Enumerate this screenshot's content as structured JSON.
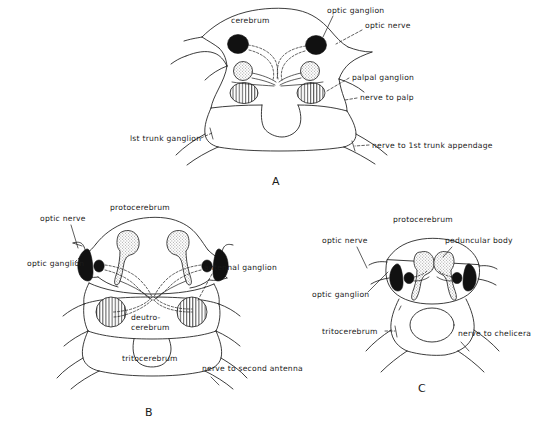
{
  "figure": {
    "background_color": "#ffffff",
    "ink_color": "#1a1a1a",
    "panels": [
      {
        "id": "A",
        "letter": "A",
        "labels": [
          {
            "name": "cerebrum",
            "text": "cerebrum"
          },
          {
            "name": "optic-ganglion",
            "text": "optic ganglion"
          },
          {
            "name": "optic-nerve",
            "text": "optic nerve"
          },
          {
            "name": "palpal-ganglion",
            "text": "palpal ganglion"
          },
          {
            "name": "nerve-to-palp",
            "text": "nerve to palp"
          },
          {
            "name": "first-trunk-ganglion",
            "text": "lst trunk ganglion"
          },
          {
            "name": "nerve-to-first-trunk-appendage",
            "text": "nerve to 1st trunk appendage"
          }
        ]
      },
      {
        "id": "B",
        "letter": "B",
        "labels": [
          {
            "name": "protocerebrum",
            "text": "protocerebrum"
          },
          {
            "name": "optic-nerve",
            "text": "optic nerve"
          },
          {
            "name": "optic-ganglion",
            "text": "optic ganglion"
          },
          {
            "name": "antennal-ganglion",
            "text": "antennal ganglion"
          },
          {
            "name": "deutocerebrum-line1",
            "text": "deutro-"
          },
          {
            "name": "deutocerebrum-line2",
            "text": "cerebrum"
          },
          {
            "name": "tritocerebrum",
            "text": "tritocerebrum"
          },
          {
            "name": "nerve-to-second-antenna",
            "text": "nerve to second antenna"
          }
        ]
      },
      {
        "id": "C",
        "letter": "C",
        "labels": [
          {
            "name": "protocerebrum",
            "text": "protocerebrum"
          },
          {
            "name": "optic-nerve",
            "text": "optic nerve"
          },
          {
            "name": "peduncular-body",
            "text": "peduncular body"
          },
          {
            "name": "optic-ganglion",
            "text": "optic ganglion"
          },
          {
            "name": "tritocerebrum",
            "text": "tritocerebrum"
          },
          {
            "name": "nerve-to-chelicera",
            "text": "nerve to chelicera"
          }
        ]
      }
    ]
  }
}
